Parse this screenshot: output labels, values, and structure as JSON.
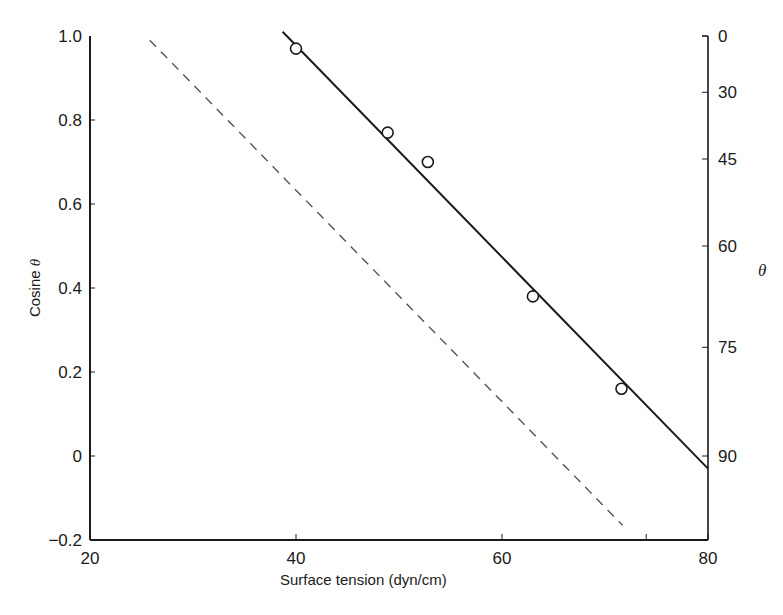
{
  "chart_data": {
    "type": "scatter",
    "title": "",
    "xlabel": "Surface tension (dyn/cm)",
    "ylabel": "Cosine θ",
    "y2label": "θ",
    "xlim": [
      20,
      80
    ],
    "ylim": [
      -0.2,
      1.0
    ],
    "grid": false,
    "legend": null,
    "x_ticks": [
      20,
      40,
      60,
      80
    ],
    "x_tick_labels": [
      "20",
      "40",
      "60",
      "80"
    ],
    "x_minor_ticks": [
      74
    ],
    "y_ticks": [
      1.0,
      0.8,
      0.6,
      0.4,
      0.2,
      0,
      -0.2
    ],
    "y_tick_labels": [
      "1.0",
      "0.8",
      "0.6",
      "0.4",
      "0.2",
      "0",
      "−0.2"
    ],
    "y2_ticks_deg": [
      0,
      30,
      45,
      60,
      75,
      90
    ],
    "y2_tick_labels": [
      "0",
      "30",
      "45",
      "60",
      "75",
      "90"
    ],
    "series": [
      {
        "name": "Measured contact angles",
        "style": "open-circle",
        "points": [
          {
            "x": 40.0,
            "y": 0.97
          },
          {
            "x": 48.9,
            "y": 0.77
          },
          {
            "x": 52.8,
            "y": 0.7
          },
          {
            "x": 63.0,
            "y": 0.38
          },
          {
            "x": 71.6,
            "y": 0.16
          }
        ]
      },
      {
        "name": "Fitted line",
        "style": "solid-line",
        "points": [
          {
            "x": 38.7,
            "y": 1.01
          },
          {
            "x": 80.0,
            "y": -0.03
          }
        ]
      },
      {
        "name": "Reference line",
        "style": "dashed-line",
        "points": [
          {
            "x": 25.8,
            "y": 0.99
          },
          {
            "x": 71.7,
            "y": -0.165
          }
        ]
      }
    ]
  },
  "labels": {
    "xlabel": "Surface tension (dyn/cm)",
    "ylabel_text": "Cosine ",
    "ylabel_symbol": "θ",
    "y2label": "θ"
  },
  "colors": {
    "ink": "#1a1a1a",
    "dashed": "#555555",
    "background": "#ffffff"
  }
}
